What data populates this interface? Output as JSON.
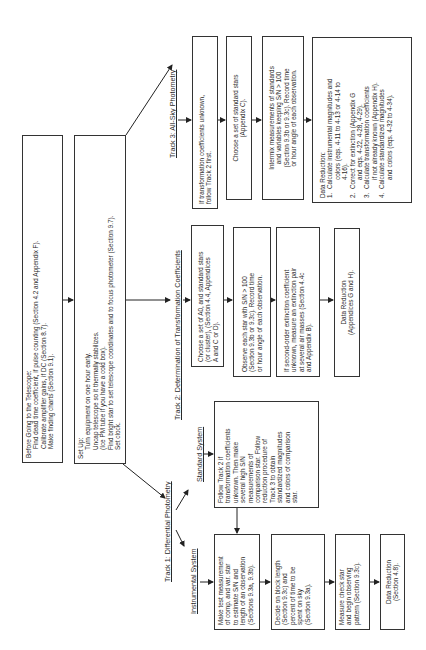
{
  "before": {
    "title": "Before Going to the Telescope:",
    "lines": [
      "Find dead time coefficient, if pulse counting (Section 4.2 and Appendix F).",
      "Calibrate amplifier gains, if DC (Section 8.7).",
      "Make finding charts (Section 9.1)."
    ]
  },
  "setup": {
    "title": "Set Up:",
    "lines": [
      "Turn equipment on one hour early.",
      "Uncap telescope so it thermally stabilizes.",
      "(Ice PM tube if you have a cold box).",
      "Find bright star to set telescope coordinates and to focus photometer (Section 9.7).",
      "Set clock."
    ]
  },
  "track1": {
    "label": "Track 1:  Differential Photometry",
    "instrumental_label": "Instrumental System",
    "standard_label": "Standard System",
    "standard_box": [
      "Follow Track 2 if",
      "transformation coefficients",
      "unknown.  Then make",
      "several high S/N",
      "measurements of",
      "comparison star.  Follow",
      "reduction procedure of",
      "Track 3 to obtain",
      "standardized magnitudes",
      "and colors of comparison",
      "star."
    ],
    "steps": [
      [
        "Make test measurement",
        "of comp. and var. star",
        "to estimate S/N and",
        "length of an observation",
        "(Sections 9.3a, 9.3b)."
      ],
      [
        "Decide on block length",
        "(Section 9.3c) and",
        "percent of time to be",
        "spent on sky",
        "(Section 9.3a)."
      ],
      [
        "Measure check star",
        "and begin observing",
        "pattern (Section 9.3c)."
      ],
      [
        "Data Reduction",
        "(Section 4.8)."
      ]
    ]
  },
  "track2": {
    "label": "Track 2:  Determination of Transformation Coefficients",
    "steps": [
      [
        "Choose a set of A0, and standard stars",
        "(or cluster), (Section 4.4, Appendices",
        "A and C or D)."
      ],
      [
        "Observe each star with S/N > 100",
        "(Section 9.3b or 9.3c).  Record time",
        "or hour angle of each observation."
      ],
      [
        "If second-order extinction coefficient",
        "unknown, measure an extinction pair",
        "at several air masses (Section 4.4c",
        "and Appendix B)."
      ],
      [
        "Data Reduction",
        "(Appendices G and H)."
      ]
    ]
  },
  "track3": {
    "label": "Track 3:  All-Sky Photometry",
    "steps": [
      [
        "If transformation coefficients unknown,",
        "follow Track 2 first."
      ],
      [
        "Choose a set of standard stars",
        "(Appendix C)."
      ],
      [
        "Intermix measurements of standards",
        "and variables keeping S/N > 100",
        "(Section 9.3b or 9.3c).  Record time",
        "or hour angle of each observation."
      ]
    ],
    "reduction": {
      "title": "Data Reduction:",
      "items": [
        {
          "num": "1.",
          "lines": [
            "Calculate instrumental magnitudes and",
            "colors (eqs. 4-11 to 4-13 or 4-14 to",
            "4-16)."
          ]
        },
        {
          "num": "2.",
          "lines": [
            "Correct for extinction (Appendix G",
            "and eqs. 4-22, 4-28, 4-29)."
          ]
        },
        {
          "num": "3.",
          "lines": [
            "Calculate transformation coefficients",
            "if not already known (Appendix H)."
          ]
        },
        {
          "num": "4.",
          "lines": [
            "Calculate standardized magnitudes",
            "and colors (eqs. 4-32 to 4-34)."
          ]
        }
      ]
    }
  }
}
